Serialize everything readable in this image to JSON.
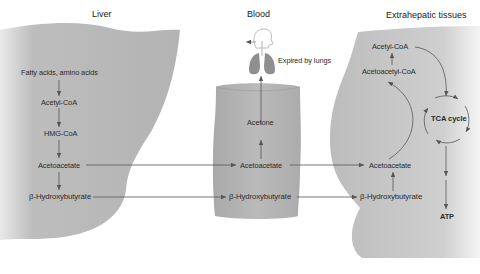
{
  "headers": {
    "liver": "Liver",
    "blood": "Blood",
    "extrahepatic": "Extrahepatic tissues"
  },
  "liver": {
    "fatty_acids": "Fatty acids, amino acids",
    "acetyl_coa": "Acetyl-CoA",
    "hmg_coa": "HMG-CoA",
    "acetoacetate": "Acetoacetate",
    "hydroxybutyrate": "β-Hydroxybutyrate"
  },
  "blood": {
    "expired": "Expired by lungs",
    "acetone": "Acetone",
    "acetoacetate": "Acetoacetate",
    "hydroxybutyrate": "β-Hydroxybutyrate"
  },
  "extrahepatic": {
    "acetyl_coa": "Acetyl-CoA",
    "acetoacetyl_coa": "Acetoacetyl-CoA",
    "tca_cycle": "TCA cycle",
    "acetoacetate": "Acetoacetate",
    "hydroxybutyrate": "β-Hydroxybutyrate",
    "atp": "ATP"
  },
  "colors": {
    "tissue_gray": "#b5b5b5",
    "arrow": "#555555",
    "lung": "#8f8f8f"
  }
}
